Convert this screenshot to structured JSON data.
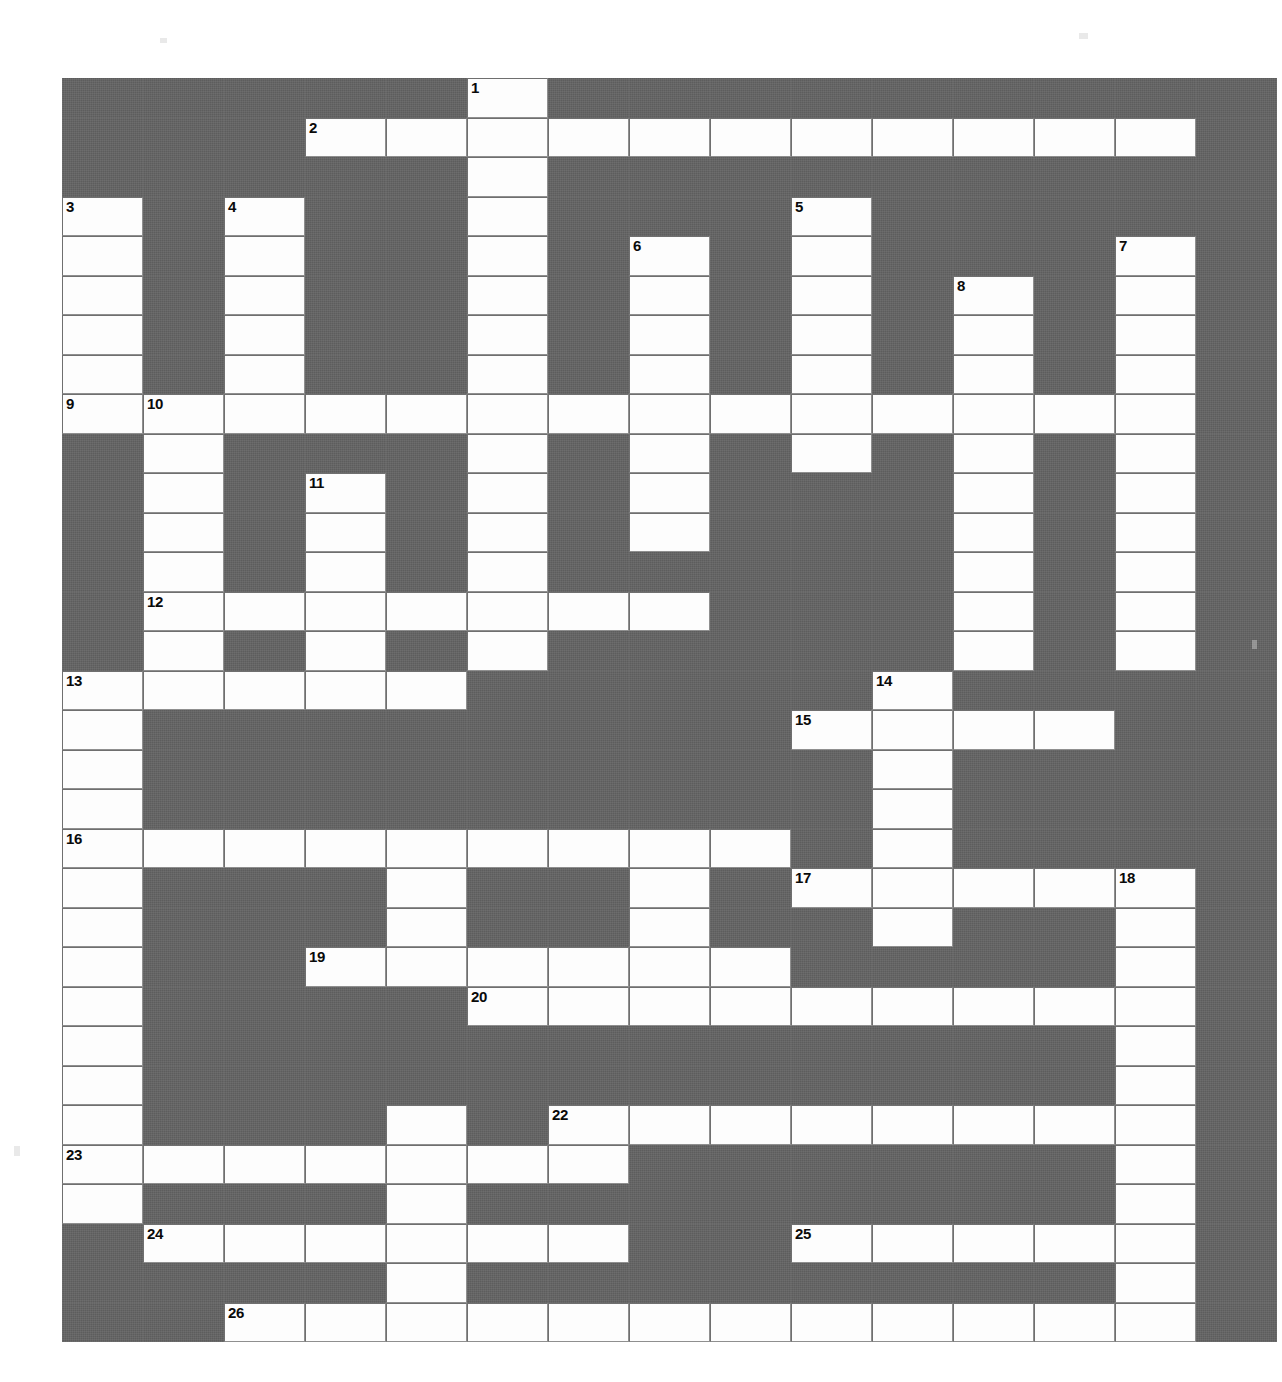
{
  "puzzle": {
    "type": "crossword-grid",
    "title": "",
    "columns": 15,
    "rows": 31,
    "cell_width_px": 81,
    "cell_height_px": 39.5,
    "colors": {
      "block": "#5d5d5d",
      "open": "#fdfdfd",
      "grid_line": "#6f6f6f",
      "number_text": "#0a0a0a",
      "page": "#ffffff"
    },
    "clue_numbers": [
      {
        "number": "1",
        "row": 0,
        "col": 5
      },
      {
        "number": "2",
        "row": 1,
        "col": 3
      },
      {
        "number": "3",
        "row": 3,
        "col": 0
      },
      {
        "number": "4",
        "row": 3,
        "col": 2
      },
      {
        "number": "5",
        "row": 3,
        "col": 9
      },
      {
        "number": "6",
        "row": 4,
        "col": 7
      },
      {
        "number": "7",
        "row": 4,
        "col": 13
      },
      {
        "number": "8",
        "row": 5,
        "col": 11
      },
      {
        "number": "9",
        "row": 8,
        "col": 0
      },
      {
        "number": "10",
        "row": 8,
        "col": 1
      },
      {
        "number": "11",
        "row": 10,
        "col": 3
      },
      {
        "number": "12",
        "row": 13,
        "col": 1
      },
      {
        "number": "13",
        "row": 15,
        "col": 0
      },
      {
        "number": "14",
        "row": 15,
        "col": 10
      },
      {
        "number": "15",
        "row": 16,
        "col": 9
      },
      {
        "number": "16",
        "row": 19,
        "col": 0
      },
      {
        "number": "17",
        "row": 20,
        "col": 9
      },
      {
        "number": "18",
        "row": 20,
        "col": 13
      },
      {
        "number": "19",
        "row": 22,
        "col": 3
      },
      {
        "number": "20",
        "row": 23,
        "col": 5
      },
      {
        "number": "22",
        "row": 26,
        "col": 6
      },
      {
        "number": "23",
        "row": 27,
        "col": 0
      },
      {
        "number": "24",
        "row": 29,
        "col": 1
      },
      {
        "number": "25",
        "row": 29,
        "col": 9
      },
      {
        "number": "26",
        "row": 31,
        "col": 2
      }
    ],
    "open_cells": [
      [
        0,
        5
      ],
      [
        1,
        3
      ],
      [
        1,
        4
      ],
      [
        1,
        5
      ],
      [
        1,
        6
      ],
      [
        1,
        7
      ],
      [
        1,
        8
      ],
      [
        1,
        9
      ],
      [
        1,
        10
      ],
      [
        1,
        11
      ],
      [
        1,
        12
      ],
      [
        1,
        13
      ],
      [
        2,
        5
      ],
      [
        3,
        0
      ],
      [
        3,
        2
      ],
      [
        3,
        5
      ],
      [
        3,
        9
      ],
      [
        4,
        0
      ],
      [
        4,
        2
      ],
      [
        4,
        5
      ],
      [
        4,
        7
      ],
      [
        4,
        9
      ],
      [
        4,
        13
      ],
      [
        5,
        0
      ],
      [
        5,
        2
      ],
      [
        5,
        5
      ],
      [
        5,
        7
      ],
      [
        5,
        9
      ],
      [
        5,
        11
      ],
      [
        5,
        13
      ],
      [
        6,
        0
      ],
      [
        6,
        2
      ],
      [
        6,
        5
      ],
      [
        6,
        7
      ],
      [
        6,
        9
      ],
      [
        6,
        11
      ],
      [
        6,
        13
      ],
      [
        7,
        0
      ],
      [
        7,
        2
      ],
      [
        7,
        5
      ],
      [
        7,
        7
      ],
      [
        7,
        9
      ],
      [
        7,
        11
      ],
      [
        7,
        13
      ],
      [
        8,
        0
      ],
      [
        8,
        1
      ],
      [
        8,
        2
      ],
      [
        8,
        3
      ],
      [
        8,
        4
      ],
      [
        8,
        5
      ],
      [
        8,
        6
      ],
      [
        8,
        7
      ],
      [
        8,
        8
      ],
      [
        8,
        9
      ],
      [
        8,
        10
      ],
      [
        8,
        11
      ],
      [
        8,
        12
      ],
      [
        8,
        13
      ],
      [
        9,
        1
      ],
      [
        9,
        5
      ],
      [
        9,
        7
      ],
      [
        9,
        9
      ],
      [
        9,
        11
      ],
      [
        9,
        13
      ],
      [
        10,
        1
      ],
      [
        10,
        3
      ],
      [
        10,
        5
      ],
      [
        10,
        7
      ],
      [
        10,
        11
      ],
      [
        10,
        13
      ],
      [
        11,
        1
      ],
      [
        11,
        3
      ],
      [
        11,
        5
      ],
      [
        11,
        7
      ],
      [
        11,
        11
      ],
      [
        11,
        13
      ],
      [
        12,
        1
      ],
      [
        12,
        3
      ],
      [
        12,
        5
      ],
      [
        12,
        11
      ],
      [
        12,
        13
      ],
      [
        13,
        1
      ],
      [
        13,
        2
      ],
      [
        13,
        3
      ],
      [
        13,
        4
      ],
      [
        13,
        5
      ],
      [
        13,
        6
      ],
      [
        13,
        7
      ],
      [
        13,
        11
      ],
      [
        13,
        13
      ],
      [
        14,
        1
      ],
      [
        14,
        3
      ],
      [
        14,
        5
      ],
      [
        14,
        11
      ],
      [
        14,
        13
      ],
      [
        15,
        0
      ],
      [
        15,
        1
      ],
      [
        15,
        2
      ],
      [
        15,
        3
      ],
      [
        15,
        4
      ],
      [
        15,
        10
      ],
      [
        16,
        0
      ],
      [
        16,
        9
      ],
      [
        16,
        10
      ],
      [
        16,
        11
      ],
      [
        16,
        12
      ],
      [
        17,
        0
      ],
      [
        17,
        10
      ],
      [
        18,
        0
      ],
      [
        18,
        10
      ],
      [
        19,
        0
      ],
      [
        19,
        1
      ],
      [
        19,
        2
      ],
      [
        19,
        3
      ],
      [
        19,
        4
      ],
      [
        19,
        5
      ],
      [
        19,
        6
      ],
      [
        19,
        7
      ],
      [
        19,
        8
      ],
      [
        19,
        10
      ],
      [
        20,
        0
      ],
      [
        20,
        4
      ],
      [
        20,
        7
      ],
      [
        20,
        9
      ],
      [
        20,
        10
      ],
      [
        20,
        11
      ],
      [
        20,
        12
      ],
      [
        20,
        13
      ],
      [
        21,
        0
      ],
      [
        21,
        4
      ],
      [
        21,
        7
      ],
      [
        21,
        10
      ],
      [
        21,
        13
      ],
      [
        22,
        0
      ],
      [
        22,
        3
      ],
      [
        22,
        4
      ],
      [
        22,
        5
      ],
      [
        22,
        6
      ],
      [
        22,
        7
      ],
      [
        22,
        8
      ],
      [
        22,
        13
      ],
      [
        23,
        0
      ],
      [
        23,
        5
      ],
      [
        23,
        6
      ],
      [
        23,
        7
      ],
      [
        23,
        8
      ],
      [
        23,
        9
      ],
      [
        23,
        10
      ],
      [
        23,
        11
      ],
      [
        23,
        12
      ],
      [
        23,
        13
      ],
      [
        24,
        0
      ],
      [
        24,
        13
      ],
      [
        25,
        0
      ],
      [
        25,
        13
      ],
      [
        26,
        0
      ],
      [
        26,
        4
      ],
      [
        26,
        6
      ],
      [
        26,
        7
      ],
      [
        26,
        8
      ],
      [
        26,
        9
      ],
      [
        26,
        10
      ],
      [
        26,
        11
      ],
      [
        26,
        12
      ],
      [
        26,
        13
      ],
      [
        27,
        0
      ],
      [
        27,
        1
      ],
      [
        27,
        2
      ],
      [
        27,
        3
      ],
      [
        27,
        4
      ],
      [
        27,
        5
      ],
      [
        27,
        6
      ],
      [
        27,
        13
      ],
      [
        28,
        0
      ],
      [
        28,
        4
      ],
      [
        28,
        13
      ],
      [
        29,
        1
      ],
      [
        29,
        2
      ],
      [
        29,
        3
      ],
      [
        29,
        4
      ],
      [
        29,
        5
      ],
      [
        29,
        6
      ],
      [
        29,
        9
      ],
      [
        29,
        10
      ],
      [
        29,
        11
      ],
      [
        29,
        12
      ],
      [
        29,
        13
      ],
      [
        30,
        4
      ],
      [
        30,
        13
      ],
      [
        31,
        2
      ],
      [
        31,
        3
      ],
      [
        31,
        4
      ],
      [
        31,
        5
      ],
      [
        31,
        6
      ],
      [
        31,
        7
      ],
      [
        31,
        8
      ],
      [
        31,
        9
      ],
      [
        31,
        10
      ],
      [
        31,
        11
      ],
      [
        31,
        12
      ],
      [
        31,
        13
      ]
    ],
    "entry_letters": []
  }
}
